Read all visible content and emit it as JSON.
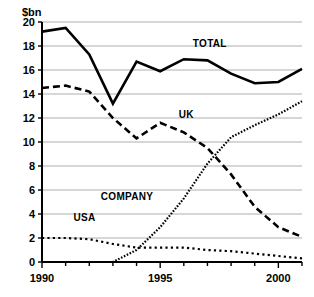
{
  "chart_data": {
    "type": "line",
    "title": "",
    "subtitle": "",
    "xlabel": "",
    "ylabel": "$bn",
    "x": [
      1990,
      1991,
      1992,
      1993,
      1994,
      1995,
      1996,
      1997,
      1998,
      1999,
      2000,
      2001
    ],
    "xlim": [
      1990,
      2001
    ],
    "ylim": [
      0,
      20
    ],
    "yticks": [
      0,
      2,
      4,
      6,
      8,
      10,
      12,
      14,
      16,
      18,
      20
    ],
    "ytick_labels": [
      "0",
      "2",
      "4",
      "6",
      "8",
      "10",
      "12",
      "14",
      "16",
      "18",
      "20"
    ],
    "xticks": [
      1990,
      1995,
      2000
    ],
    "xtick_labels": [
      "1990",
      "1995",
      "2000"
    ],
    "xtick_minor": [
      1991,
      1992,
      1993,
      1994,
      1996,
      1997,
      1998,
      1999,
      2001
    ],
    "grid": "horizontal",
    "legend": "inline-annotations",
    "series": [
      {
        "name": "TOTAL",
        "style": "solid",
        "color": "#000000",
        "values": [
          19.2,
          19.5,
          17.3,
          13.2,
          16.7,
          15.9,
          16.9,
          16.8,
          15.7,
          14.9,
          15.0,
          16.1
        ],
        "label_x": 1997.1,
        "label_y": 17.9
      },
      {
        "name": "UK",
        "style": "dashed",
        "color": "#000000",
        "values": [
          14.5,
          14.7,
          14.2,
          12.0,
          10.3,
          11.6,
          10.8,
          9.5,
          7.3,
          4.6,
          2.9,
          2.1
        ],
        "label_x": 1996.1,
        "label_y": 12.0
      },
      {
        "name": "COMPANY",
        "style": "dotted",
        "color": "#000000",
        "values": [
          0.0,
          0.0,
          0.0,
          0.0,
          1.0,
          2.9,
          5.3,
          8.2,
          10.4,
          11.4,
          12.3,
          13.4
        ],
        "label_x": 1993.6,
        "label_y": 5.2
      },
      {
        "name": "USA",
        "style": "fine-dotted",
        "color": "#000000",
        "values": [
          2.0,
          2.0,
          1.9,
          1.5,
          1.2,
          1.2,
          1.2,
          1.0,
          0.9,
          0.7,
          0.5,
          0.3
        ],
        "label_x": 1991.8,
        "label_y": 3.4
      }
    ]
  }
}
